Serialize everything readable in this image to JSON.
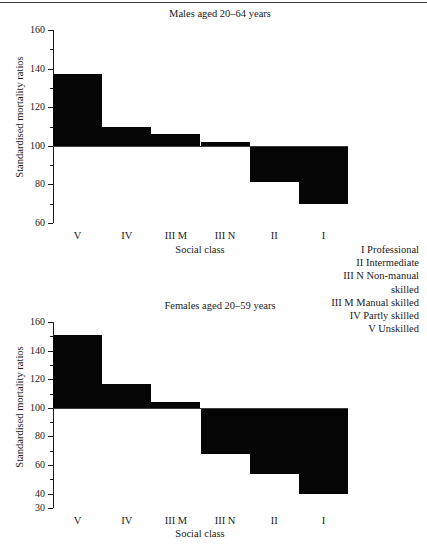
{
  "figure": {
    "legend": {
      "entries": [
        "I Professional",
        "II Intermediate",
        "III N Non-manual",
        "skilled",
        "III M Manual skilled",
        "IV Partly skilled",
        "V Unskilled"
      ]
    }
  },
  "chart_data": [
    {
      "type": "bar",
      "title": "Males aged 20–64 years",
      "xlabel": "Social class",
      "ylabel": "Standardised mortality ratios",
      "categories": [
        "V",
        "IV",
        "III M",
        "III N",
        "II",
        "I"
      ],
      "values": [
        137,
        110,
        106,
        102,
        81,
        70
      ],
      "ylim": [
        60,
        160
      ],
      "yticks": [
        60,
        80,
        100,
        120,
        140,
        160
      ],
      "ytick_labels": [
        "60",
        "80",
        "100",
        "120",
        "140",
        "160"
      ],
      "yminor_step": 10,
      "baseline": 100,
      "grid": false,
      "legend_position": "right-outside",
      "bar_color": "#050505"
    },
    {
      "type": "bar",
      "title": "Females aged 20–59 years",
      "xlabel": "Social class",
      "ylabel": "Standardised mortality ratios",
      "categories": [
        "V",
        "IV",
        "III M",
        "III N",
        "II",
        "I"
      ],
      "values": [
        151,
        117,
        104,
        68,
        54,
        40
      ],
      "ylim": [
        30,
        160
      ],
      "yticks": [
        30,
        40,
        60,
        80,
        100,
        120,
        140,
        160
      ],
      "ytick_labels": [
        "30",
        "40",
        "60",
        "80",
        "100",
        "120",
        "140",
        "160"
      ],
      "yminor_step": 10,
      "baseline": 100,
      "grid": false,
      "legend_position": "none",
      "bar_color": "#050505"
    }
  ]
}
